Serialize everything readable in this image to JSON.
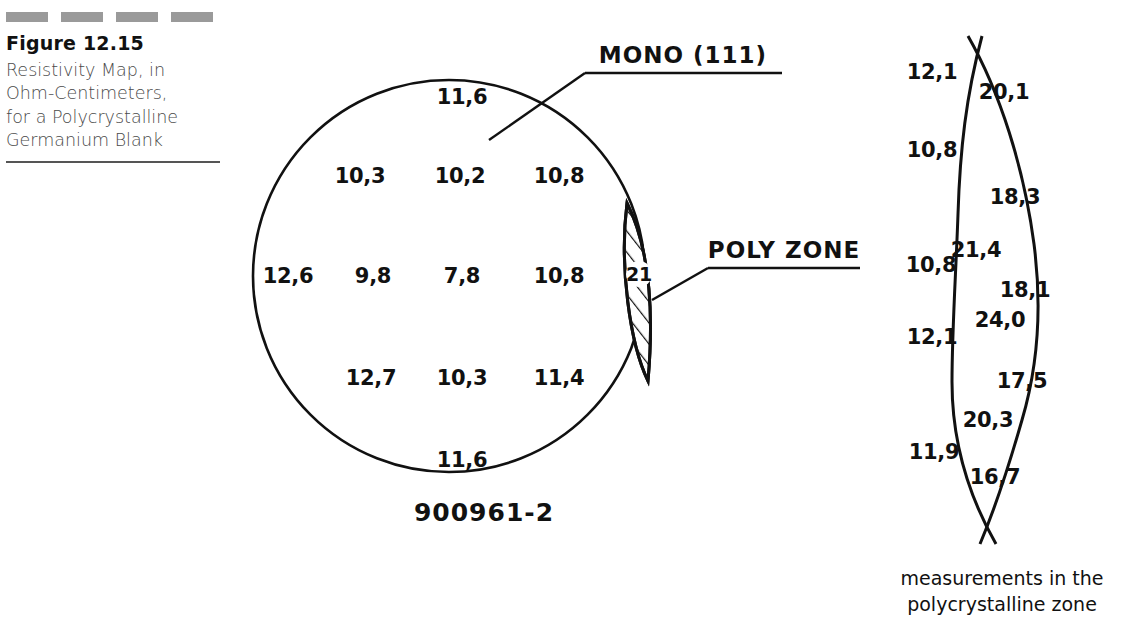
{
  "figure": {
    "number": "Figure 12.15",
    "caption_lines": [
      "Resistivity Map, in",
      "Ohm-Centimeters,",
      "for a Polycrystalline",
      "Germanium Blank"
    ],
    "rule_color": "#9a9a9a",
    "ink_color": "#111111"
  },
  "wafer_map": {
    "serial": "900961-2",
    "mono_label": "MONO (111)",
    "poly_label": "POLY ZONE",
    "poly_zone_value": "21",
    "readings": [
      {
        "value": "11,6",
        "x": 462,
        "y": 97
      },
      {
        "value": "10,3",
        "x": 360,
        "y": 176
      },
      {
        "value": "10,2",
        "x": 460,
        "y": 176
      },
      {
        "value": "10,8",
        "x": 559,
        "y": 176
      },
      {
        "value": "12,6",
        "x": 288,
        "y": 276
      },
      {
        "value": "9,8",
        "x": 373,
        "y": 276
      },
      {
        "value": "7,8",
        "x": 462,
        "y": 276
      },
      {
        "value": "10,8",
        "x": 559,
        "y": 276
      },
      {
        "value": "12,7",
        "x": 371,
        "y": 378
      },
      {
        "value": "10,3",
        "x": 462,
        "y": 378
      },
      {
        "value": "11,4",
        "x": 559,
        "y": 378
      },
      {
        "value": "11,6",
        "x": 462,
        "y": 460
      }
    ]
  },
  "poly_zone_detail": {
    "caption_lines": [
      "measurements in the",
      "polycrystalline zone"
    ],
    "readings": [
      {
        "value": "12,1",
        "x": 932,
        "y": 72,
        "side": "left"
      },
      {
        "value": "20,1",
        "x": 1004,
        "y": 92,
        "side": "right"
      },
      {
        "value": "10,8",
        "x": 932,
        "y": 150,
        "side": "left"
      },
      {
        "value": "18,3",
        "x": 1015,
        "y": 197,
        "side": "right"
      },
      {
        "value": "21,4",
        "x": 976,
        "y": 250,
        "side": "right"
      },
      {
        "value": "10,8",
        "x": 931,
        "y": 265,
        "side": "left"
      },
      {
        "value": "18,1",
        "x": 1025,
        "y": 290,
        "side": "right"
      },
      {
        "value": "24,0",
        "x": 1000,
        "y": 320,
        "side": "right"
      },
      {
        "value": "12,1",
        "x": 932,
        "y": 337,
        "side": "left"
      },
      {
        "value": "17,5",
        "x": 1022,
        "y": 381,
        "side": "right"
      },
      {
        "value": "20,3",
        "x": 988,
        "y": 420,
        "side": "right"
      },
      {
        "value": "11,9",
        "x": 934,
        "y": 452,
        "side": "left"
      },
      {
        "value": "16,7",
        "x": 995,
        "y": 477,
        "side": "right"
      }
    ]
  }
}
